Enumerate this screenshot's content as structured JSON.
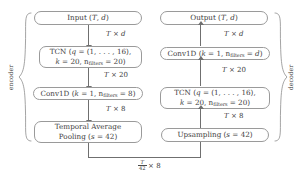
{
  "diagram": {
    "encoder": {
      "brace_label": "encoder",
      "blocks": [
        {
          "id": "input",
          "text": "Input (T, d)"
        },
        {
          "id": "tcn-encoder",
          "line1": "TCN (q = (1, . . . , 16),",
          "line2_pre": "k = 20, n",
          "line2_sub": "filters",
          "line2_post": " = 20)"
        },
        {
          "id": "conv1d-encoder",
          "pre": "Conv1D (k = 1, n",
          "sub": "filters",
          "post": " = 8)"
        },
        {
          "id": "temporal-average-pooling",
          "line1": "Temporal Average",
          "line2": "Pooling (s = 42)"
        }
      ],
      "edge_labels": [
        {
          "id": "enc-edge-1",
          "text": "T × d"
        },
        {
          "id": "enc-edge-2",
          "text": "T × 20"
        },
        {
          "id": "enc-edge-3",
          "text": "T × 8"
        }
      ]
    },
    "decoder": {
      "brace_label": "decoder",
      "blocks": [
        {
          "id": "output",
          "text": "Output (T, d)"
        },
        {
          "id": "conv1d-decoder",
          "pre": "Conv1D (k = 1, n",
          "sub": "filters",
          "post": " = d)"
        },
        {
          "id": "tcn-decoder",
          "line1": "TCN (q = (1, . . . , 16),",
          "line2_pre": "k = 20, n",
          "line2_sub": "filters",
          "line2_post": " = 20)"
        },
        {
          "id": "upsampling",
          "text": "Upsampling (s = 42)"
        }
      ],
      "edge_labels": [
        {
          "id": "dec-edge-1",
          "text": "T × d"
        },
        {
          "id": "dec-edge-2",
          "text": "T × 20"
        },
        {
          "id": "dec-edge-3",
          "text": "T × 8"
        }
      ]
    },
    "bottom_connector": {
      "id": "latent-connector",
      "numerator": "T",
      "denominator": "42",
      "suffix": "× 8"
    },
    "colors": {
      "box_border": "#9a9a9a",
      "arrow": "#6f6f6f",
      "text": "#3c3c3c",
      "background": "#ffffff"
    }
  }
}
